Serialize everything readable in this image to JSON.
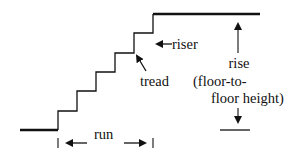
{
  "diagram": {
    "colors": {
      "line": "#111111",
      "background": "#ffffff"
    },
    "labels": {
      "riser": "riser",
      "tread": "tread",
      "rise_line1": "rise",
      "rise_line2": "(floor-to-",
      "rise_line3": "floor height)",
      "run": "run"
    },
    "staircase": {
      "bottom_floor": {
        "x1": 20,
        "x2": 58,
        "y": 130
      },
      "top_floor": {
        "x1": 153,
        "x2": 260,
        "y": 14
      },
      "steps": [
        {
          "x": 58,
          "y_bottom": 130,
          "y_top": 111
        },
        {
          "x": 77,
          "y_bottom": 111,
          "y_top": 91
        },
        {
          "x": 96,
          "y_bottom": 91,
          "y_top": 72
        },
        {
          "x": 115,
          "y_bottom": 72,
          "y_top": 53
        },
        {
          "x": 134,
          "y_bottom": 53,
          "y_top": 33
        },
        {
          "x": 153,
          "y_bottom": 33,
          "y_top": 14
        }
      ],
      "step_count": 6
    },
    "annotations": {
      "riser_arrow": {
        "points_to": "riser",
        "direction": "left"
      },
      "tread_arrow": {
        "points_to": "tread",
        "direction": "up-left"
      },
      "rise_dimension": {
        "top_y": 14,
        "bottom_y": 130,
        "x": 238
      },
      "run_dimension": {
        "left_x": 58,
        "right_x": 153,
        "y": 145
      }
    }
  }
}
